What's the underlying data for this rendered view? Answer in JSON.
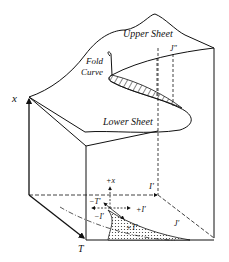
{
  "diagram": {
    "labels": {
      "upper_sheet": "Upper Sheet",
      "lower_sheet": "Lower Sheet",
      "fold": "Fold",
      "curve": "Curve",
      "j_double_prime": "J″",
      "x_axis": "x",
      "t_axis": "T",
      "i_prime_axis": "I′",
      "plus_x": "+x",
      "minus_t_prime": "−T′",
      "minus_i_prime": "−I′",
      "plus_i_prime": "+I′",
      "plus_t_prime": "+T′",
      "j_prime": "J′"
    },
    "colors": {
      "line": "#111111",
      "background": "#ffffff"
    }
  }
}
